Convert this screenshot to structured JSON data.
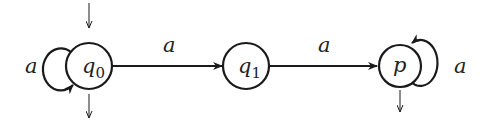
{
  "diagram": {
    "type": "finite-automaton",
    "stroke_color": "#1a1a1a",
    "background": "#ffffff",
    "states": [
      {
        "id": "q0",
        "label_base": "q",
        "label_sub": "0",
        "initial": true,
        "final": true,
        "self_loop": "a"
      },
      {
        "id": "q1",
        "label_base": "q",
        "label_sub": "1",
        "initial": false,
        "final": false
      },
      {
        "id": "p",
        "label_base": "p",
        "label_sub": "",
        "initial": false,
        "final": true,
        "self_loop": "a"
      }
    ],
    "transitions": [
      {
        "from": "q0",
        "to": "q0",
        "label": "a"
      },
      {
        "from": "q0",
        "to": "q1",
        "label": "a"
      },
      {
        "from": "q1",
        "to": "p",
        "label": "a"
      },
      {
        "from": "p",
        "to": "p",
        "label": "a"
      }
    ],
    "labels": {
      "q0_loop": "a",
      "q0_q1": "a",
      "q1_p": "a",
      "p_loop": "a"
    }
  }
}
